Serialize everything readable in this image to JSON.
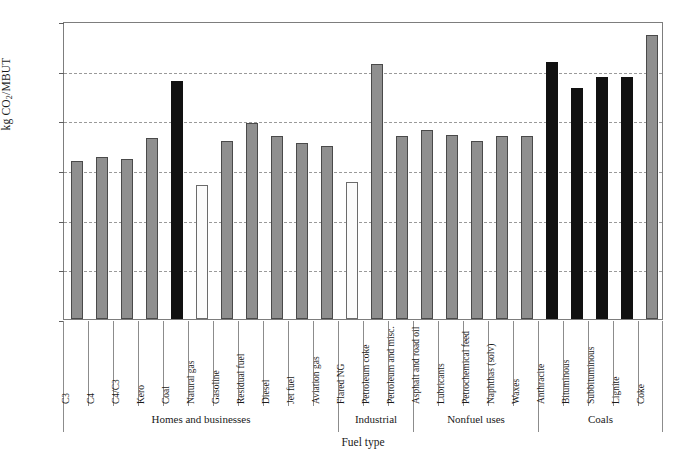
{
  "chart_data": {
    "type": "bar",
    "title": "",
    "xlabel": "Fuel type",
    "ylabel": "kg CO2/MBUT",
    "ylabel_parts": {
      "prefix": "kg CO",
      "sub": "2",
      "suffix": "/MBUT"
    },
    "ylim": [
      0,
      120
    ],
    "ytick_values": [
      0,
      20,
      40,
      60,
      80,
      100,
      120
    ],
    "ytick_labels": [
      "0",
      "20",
      "40",
      "60",
      "80",
      "100",
      "120"
    ],
    "grid": true,
    "grid_style": "dashed-horizontal",
    "legend": "none",
    "categories": [
      "C3",
      "C4",
      "C4/C3",
      "Kero",
      "Coal",
      "Natural gas",
      "Gasoline",
      "Residual fuel",
      "Diesel",
      "Jet fuel",
      "Aviation gas",
      "Flared NG",
      "Petroleum coke",
      "Petroleum and misc.",
      "Asphalt and road oil",
      "Lubricants",
      "Petrochemical feed",
      "Naphthas (solv)",
      "Waxes",
      "Anthracite",
      "Bituminous",
      "Subbituminous",
      "Lignite",
      "Coke"
    ],
    "values": [
      63.5,
      65.3,
      64.5,
      72.7,
      95.8,
      53.8,
      71.5,
      78.8,
      73.7,
      71.0,
      69.7,
      55.0,
      102.5,
      73.5,
      76.0,
      73.9,
      71.5,
      73.5,
      73.7,
      103.5,
      93.0,
      97.5,
      97.5,
      114.5
    ],
    "bar_colors": [
      "gray",
      "gray",
      "gray",
      "gray",
      "black",
      "white",
      "gray",
      "gray",
      "gray",
      "gray",
      "gray",
      "white",
      "gray",
      "gray",
      "gray",
      "gray",
      "gray",
      "gray",
      "gray",
      "black",
      "black",
      "black",
      "black",
      "gray"
    ],
    "groups": [
      {
        "label": "Homes and businesses",
        "start": 0,
        "count": 11
      },
      {
        "label": "Industrial",
        "start": 11,
        "count": 3
      },
      {
        "label": "Nonfuel uses",
        "start": 14,
        "count": 5
      },
      {
        "label": "Coals",
        "start": 19,
        "count": 5
      }
    ],
    "palette": {
      "gray": "#8f8f8f",
      "black": "#111111",
      "white": "#fbfbfb",
      "outline": "#4a4a4a",
      "grid": "#9a9a9a",
      "axis": "#7d7d7d"
    }
  }
}
